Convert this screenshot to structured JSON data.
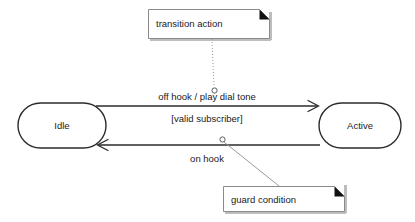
{
  "diagram": {
    "type": "uml-state-machine",
    "background_color": "#ffffff",
    "line_color": "#2b2b2b",
    "note_border_color": "#8a8a8a",
    "leader_color": "#9a9a9a"
  },
  "states": [
    {
      "id": "idle",
      "label": "Idle"
    },
    {
      "id": "active",
      "label": "Active"
    }
  ],
  "transitions": [
    {
      "id": "idle-to-active",
      "from": "Idle",
      "to": "Active",
      "direction": "right",
      "event_action_label": "off hook / play dial tone",
      "guard_label": "[valid subscriber]"
    },
    {
      "id": "active-to-idle",
      "from": "Active",
      "to": "Idle",
      "direction": "left",
      "event_action_label": "on hook"
    }
  ],
  "notes": [
    {
      "id": "note-transition-action",
      "label": "transition action",
      "leader_style": "dotted",
      "points_to": "off hook / play dial tone"
    },
    {
      "id": "note-guard-condition",
      "label": "guard condition",
      "leader_style": "solid",
      "points_to": "[valid subscriber]"
    }
  ]
}
